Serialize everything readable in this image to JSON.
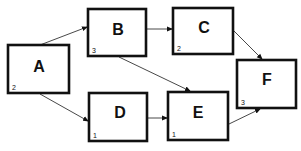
{
  "diagram": {
    "type": "activity-network",
    "nodes": [
      {
        "id": "A",
        "label": "A",
        "duration": "2",
        "x": 8,
        "y": 45,
        "w": 61,
        "h": 48
      },
      {
        "id": "B",
        "label": "B",
        "duration": "3",
        "x": 88,
        "y": 9,
        "w": 58,
        "h": 47
      },
      {
        "id": "C",
        "label": "C",
        "duration": "2",
        "x": 173,
        "y": 8,
        "w": 60,
        "h": 46
      },
      {
        "id": "D",
        "label": "D",
        "duration": "1",
        "x": 89,
        "y": 93,
        "w": 58,
        "h": 48
      },
      {
        "id": "E",
        "label": "E",
        "duration": "1",
        "x": 168,
        "y": 92,
        "w": 60,
        "h": 48
      },
      {
        "id": "F",
        "label": "F",
        "duration": "3",
        "x": 237,
        "y": 60,
        "w": 59,
        "h": 48
      }
    ],
    "edges": [
      {
        "from": "A",
        "to": "B"
      },
      {
        "from": "A",
        "to": "D"
      },
      {
        "from": "B",
        "to": "C"
      },
      {
        "from": "B",
        "to": "E"
      },
      {
        "from": "D",
        "to": "E"
      },
      {
        "from": "C",
        "to": "F"
      },
      {
        "from": "E",
        "to": "F"
      }
    ]
  },
  "labels": {
    "A": "A",
    "B": "B",
    "C": "C",
    "D": "D",
    "E": "E",
    "F": "F"
  },
  "durations": {
    "A": "2",
    "B": "3",
    "C": "2",
    "D": "1",
    "E": "1",
    "F": "3"
  }
}
